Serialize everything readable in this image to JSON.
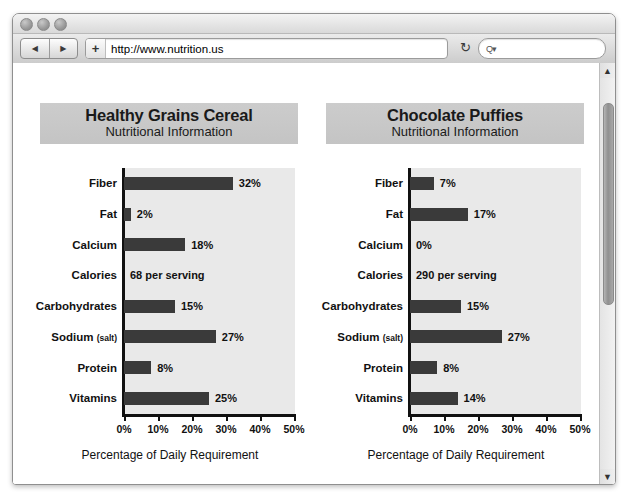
{
  "window": {
    "traffic_lights": [
      "close",
      "minimize",
      "zoom"
    ],
    "toolbar": {
      "back_glyph": "◀",
      "forward_glyph": "▶",
      "add_bookmark_label": "+",
      "url_value": "http://www.nutrition.us",
      "url_placeholder": "Enter address",
      "reload_glyph": "↻",
      "search_glyph": "Q▾",
      "search_placeholder": ""
    },
    "scrollbar": {
      "up_glyph": "▲",
      "down_glyph": "▼"
    }
  },
  "chart_data": [
    {
      "type": "bar",
      "orientation": "horizontal",
      "title": "Healthy Grains Cereal",
      "subtitle": "Nutritional Information",
      "xlabel": "Percentage of Daily Requirement",
      "ylabel": "",
      "xlim": [
        0,
        50
      ],
      "xticks": [
        0,
        10,
        20,
        30,
        40,
        50
      ],
      "xtick_labels": [
        "0%",
        "10%",
        "20%",
        "30%",
        "40%",
        "50%"
      ],
      "grid": false,
      "legend": "none",
      "categories": [
        "Fiber",
        "Fat",
        "Calcium",
        "Calories",
        "Carbohydrates",
        "Sodium (salt)",
        "Protein",
        "Vitamins"
      ],
      "category_sub": [
        "",
        "",
        "",
        "",
        "",
        "(salt)",
        "",
        ""
      ],
      "values": [
        32,
        2,
        18,
        null,
        15,
        27,
        8,
        25
      ],
      "value_labels": [
        "32%",
        "2%",
        "18%",
        "68 per serving",
        "15%",
        "27%",
        "8%",
        "25%"
      ]
    },
    {
      "type": "bar",
      "orientation": "horizontal",
      "title": "Chocolate Puffies",
      "subtitle": "Nutritional Information",
      "xlabel": "Percentage of Daily Requirement",
      "ylabel": "",
      "xlim": [
        0,
        50
      ],
      "xticks": [
        0,
        10,
        20,
        30,
        40,
        50
      ],
      "xtick_labels": [
        "0%",
        "10%",
        "20%",
        "30%",
        "40%",
        "50%"
      ],
      "grid": false,
      "legend": "none",
      "categories": [
        "Fiber",
        "Fat",
        "Calcium",
        "Calories",
        "Carbohydrates",
        "Sodium (salt)",
        "Protein",
        "Vitamins"
      ],
      "category_sub": [
        "",
        "",
        "",
        "",
        "",
        "(salt)",
        "",
        ""
      ],
      "values": [
        7,
        17,
        0,
        null,
        15,
        27,
        8,
        14
      ],
      "value_labels": [
        "7%",
        "17%",
        "0%",
        "290 per serving",
        "15%",
        "27%",
        "8%",
        "14%"
      ]
    }
  ],
  "colors": {
    "bar": "#3a3a3a",
    "plot_background": "#e9e9e9",
    "banner_background": "#c8c8c8",
    "page_background": "#ffffff",
    "axis": "#111111"
  }
}
